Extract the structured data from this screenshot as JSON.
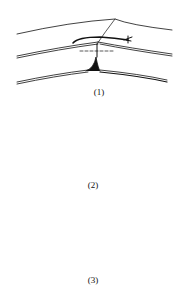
{
  "diagram": {
    "panels": [
      {
        "label": "(1)"
      },
      {
        "label": "(2)"
      },
      {
        "label": "(3)"
      }
    ],
    "colors": {
      "stroke": "#111111",
      "background": "#ffffff"
    }
  }
}
